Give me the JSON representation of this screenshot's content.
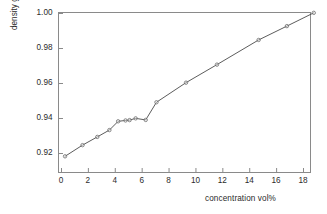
{
  "chart_data": {
    "type": "line",
    "title": "",
    "xlabel": "concentration vol%",
    "ylabel": "density g/ml",
    "xlim": [
      0,
      18.8
    ],
    "ylim": [
      0.91,
      1.0
    ],
    "grid": false,
    "legend": null,
    "xticks": [
      "0",
      "2",
      "4",
      "6",
      "8",
      "10",
      "12",
      "14",
      "16",
      "18"
    ],
    "xtick_values": [
      0,
      2,
      4,
      6,
      8,
      10,
      12,
      14,
      16,
      18
    ],
    "yticks": [
      "0.92",
      "0.94",
      "0.96",
      "0.98",
      "1.00"
    ],
    "ytick_values": [
      0.92,
      0.94,
      0.96,
      0.98,
      1.0
    ],
    "series": [
      {
        "name": "density vs concentration",
        "marker": "open-circle",
        "line_color": "#4a4a4a",
        "marker_color": "#6a6a6a",
        "x": [
          0.3,
          1.6,
          2.7,
          3.6,
          4.25,
          4.8,
          5.1,
          5.55,
          6.3,
          7.1,
          9.3,
          11.6,
          14.7,
          16.8,
          18.8
        ],
        "y": [
          0.9181,
          0.9245,
          0.9292,
          0.9331,
          0.9381,
          0.9386,
          0.9388,
          0.9398,
          0.9389,
          0.949,
          0.9602,
          0.9705,
          0.9846,
          0.9925,
          1.0001
        ]
      }
    ]
  },
  "axes": {
    "frame_color": "#8a8a8a",
    "tick_color": "#8a8a8a",
    "text_color": "#2b2b2b"
  }
}
